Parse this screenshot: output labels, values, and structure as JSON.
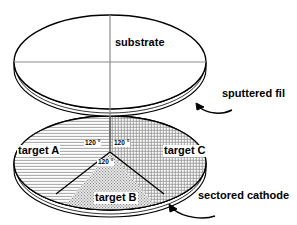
{
  "figure": {
    "type": "diagram",
    "background_color": "#ffffff",
    "line_color": "#000000",
    "crosshair_color": "#808080"
  },
  "substrate_disc": {
    "label": "substrate",
    "crosshair": {
      "vertical": true,
      "horizontal": true
    }
  },
  "cathode_disc": {
    "sectors": [
      {
        "id": "target-a",
        "label": "target A",
        "angle_label": "120 °",
        "hatch": "horizontal-lines",
        "fill_color": "#f2f2f2"
      },
      {
        "id": "target-b",
        "label": "target B",
        "angle_label": "120 °",
        "hatch": "stipple-dots",
        "fill_color": "#e0e0e0"
      },
      {
        "id": "target-c",
        "label": "target C",
        "angle_label": "120 °",
        "hatch": "cross-hatch-grid",
        "fill_color": "#f2f2f2"
      }
    ]
  },
  "callouts": [
    {
      "id": "sputtered-film",
      "label": "sputtered fil",
      "arrow": "curved-arrow-up-left",
      "points_to": "substrate-disc-edge"
    },
    {
      "id": "sectored-cathode",
      "label": "sectored cathode",
      "arrow": "curved-arrow-up-left",
      "points_to": "cathode-disc-edge"
    }
  ]
}
